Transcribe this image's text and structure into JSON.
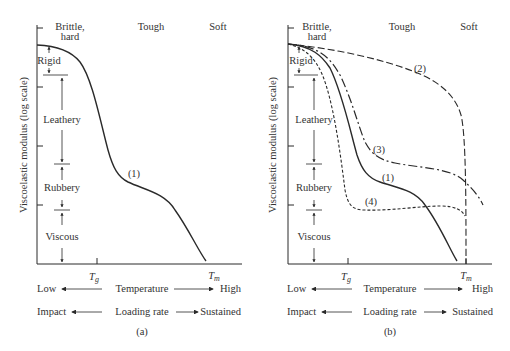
{
  "panels": [
    {
      "id": "a",
      "caption": "(a)",
      "ylabel": "Viscoelastic modulus (log scale)",
      "top_labels": {
        "brittle_1": "Brittle,",
        "brittle_2": "hard",
        "tough": "Tough",
        "soft": "Soft"
      },
      "regions": [
        "Rigid",
        "Leathery",
        "Rubbery",
        "Viscous"
      ],
      "x_ticks": {
        "tg": "T",
        "tg_sub": "g",
        "tm": "T",
        "tm_sub": "m"
      },
      "curve_labels": [
        "(1)"
      ],
      "temperature": {
        "low": "Low",
        "label": "Temperature",
        "high": "High"
      },
      "loading": {
        "low": "Impact",
        "label": "Loading rate",
        "high": "Sustained"
      }
    },
    {
      "id": "b",
      "caption": "(b)",
      "ylabel": "Viscoelastic modulus (log scale)",
      "top_labels": {
        "brittle_1": "Brittle,",
        "brittle_2": "hard",
        "tough": "Tough",
        "soft": "Soft"
      },
      "regions": [
        "Rigid",
        "Leathery",
        "Rubbery",
        "Viscous"
      ],
      "x_ticks": {
        "tg": "T",
        "tg_sub": "g",
        "tm": "T",
        "tm_sub": "m"
      },
      "curve_labels": [
        "(1)",
        "(2)",
        "(3)",
        "(4)"
      ],
      "temperature": {
        "low": "Low",
        "label": "Temperature",
        "high": "High"
      },
      "loading": {
        "low": "Impact",
        "label": "Loading rate",
        "high": "Sustained"
      }
    }
  ],
  "colors": {
    "ink": "#2a2a2a",
    "background": "#ffffff"
  }
}
